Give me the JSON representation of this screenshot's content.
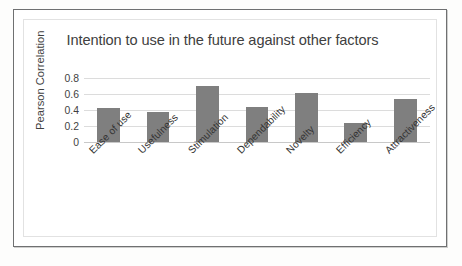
{
  "chart_data": {
    "type": "bar",
    "title": "Intention to use in the future against other factors",
    "xlabel": "",
    "ylabel": "Pearson Correlation",
    "categories": [
      "Ease of use",
      "Usefulness",
      "Stimulation",
      "Dependability",
      "Novelty",
      "Efficiency",
      "Attractiveness"
    ],
    "values": [
      0.42,
      0.37,
      0.7,
      0.44,
      0.61,
      0.24,
      0.54
    ],
    "ylim": [
      0,
      0.8
    ],
    "yticks": [
      "0",
      "0.2",
      "0.4",
      "0.6",
      "0.8"
    ],
    "ytick_values": [
      0,
      0.2,
      0.4,
      0.6,
      0.8
    ],
    "grid": true,
    "legend": false,
    "series_color": "#7f7f7f"
  }
}
